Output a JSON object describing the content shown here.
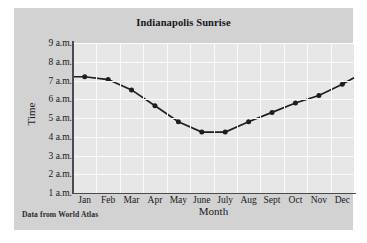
{
  "figure": {
    "title": "Indianapolis Sunrise",
    "source_note": "Data from World Atlas",
    "panel_color": "#d2d2d2",
    "plot_color": "#e7e7e7",
    "grid_color": "#fbfbfb",
    "axis_color": "#4a4a50",
    "series_color": "#1d1d22"
  },
  "chart_data": {
    "type": "line",
    "title": "Indianapolis Sunrise",
    "xlabel": "Month",
    "ylabel": "Time",
    "categories": [
      "Jan",
      "Feb",
      "Mar",
      "Apr",
      "May",
      "June",
      "July",
      "Aug",
      "Sept",
      "Oct",
      "Nov",
      "Dec"
    ],
    "ytick_labels": [
      "1 a.m.",
      "2 a.m.",
      "3 a.m.",
      "4 a.m.",
      "5 a.m.",
      "6 a.m.",
      "7 a.m.",
      "8 a.m.",
      "9 a.m."
    ],
    "ytick_values": [
      1,
      2,
      3,
      4,
      5,
      6,
      7,
      8,
      9
    ],
    "ylim": [
      1,
      9
    ],
    "grid": true,
    "legend": "none",
    "series": [
      {
        "name": "Sunrise time",
        "marker": "filled-dot",
        "values": [
          7.2,
          7.05,
          6.5,
          5.65,
          4.8,
          4.25,
          4.25,
          4.8,
          5.3,
          5.8,
          6.2,
          6.8
        ]
      }
    ],
    "line_extends_to_edges": true,
    "edge_values": {
      "left": 7.2,
      "right": 7.15
    }
  }
}
